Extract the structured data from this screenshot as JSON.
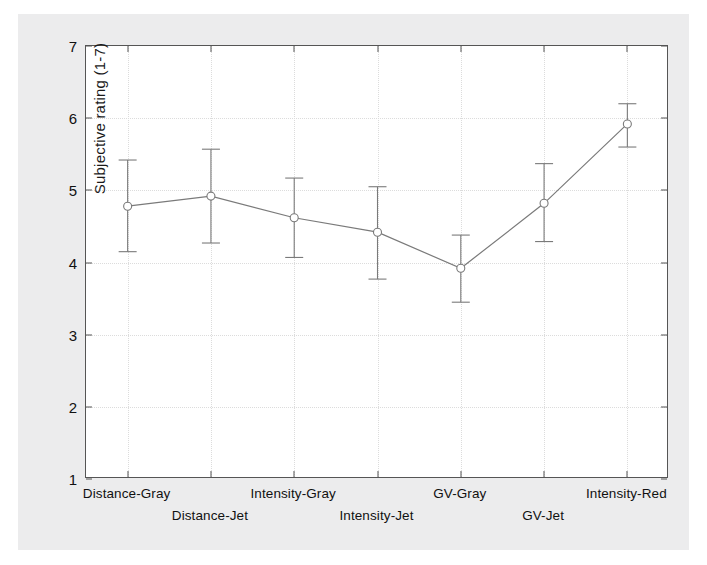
{
  "chart_data": {
    "type": "line",
    "title": "",
    "subtitle": "",
    "xlabel": "",
    "ylabel": "Subjective rating (1-7)",
    "ylim": [
      1,
      7
    ],
    "y_ticks": [
      1,
      2,
      3,
      4,
      5,
      6,
      7
    ],
    "grid": true,
    "legend": "none",
    "error_bars": "present",
    "marker": "open-circle",
    "line_color": "#7a7a7a",
    "marker_edge_color": "#7a7a7a",
    "marker_face_color": "#ffffff",
    "grid_color": "#dcdcdc",
    "axis_color": "#555555",
    "background_color": "#ffffff",
    "page_background_color": "#ececed",
    "categories": [
      "Distance-Gray",
      "Distance-Jet",
      "Intensity-Gray",
      "Intensity-Jet",
      "GV-Gray",
      "GV-Jet",
      "Intensity-Red"
    ],
    "values": [
      4.78,
      4.92,
      4.62,
      4.42,
      3.92,
      4.82,
      5.92
    ],
    "error_low": [
      4.15,
      4.27,
      4.07,
      3.77,
      3.45,
      4.29,
      5.6
    ],
    "error_high": [
      5.42,
      5.57,
      5.17,
      5.05,
      4.38,
      5.37,
      6.2
    ],
    "series": [
      {
        "name": "Subjective rating",
        "values": [
          4.78,
          4.92,
          4.62,
          4.42,
          3.92,
          4.82,
          5.92
        ],
        "error_low": [
          4.15,
          4.27,
          4.07,
          3.77,
          3.45,
          4.29,
          5.6
        ],
        "error_high": [
          5.42,
          5.57,
          5.17,
          5.05,
          4.38,
          5.37,
          6.2
        ]
      }
    ]
  },
  "axis": {
    "y_label": "Subjective rating (1-7)",
    "y_tick_labels": [
      "1",
      "2",
      "3",
      "4",
      "5",
      "6",
      "7"
    ],
    "x_tick_labels": [
      "Distance-Gray",
      "Distance-Jet",
      "Intensity-Gray",
      "Intensity-Jet",
      "GV-Gray",
      "GV-Jet",
      "Intensity-Red"
    ]
  }
}
